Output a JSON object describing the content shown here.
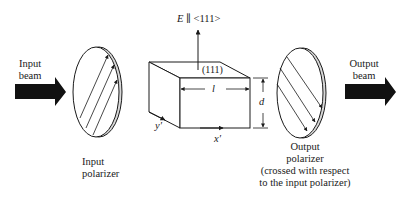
{
  "diagram": {
    "input_beam_label": [
      "Input",
      "beam"
    ],
    "output_beam_label": [
      "Output",
      "beam"
    ],
    "input_polarizer_label": [
      "Input",
      "polarizer"
    ],
    "output_polarizer_label": [
      "Output",
      "polarizer",
      "(crossed with respect",
      "to the input polarizer)"
    ],
    "field_label_E": "E",
    "field_label_rest": " ∥ <111>",
    "crystal_face_label": "(111)",
    "length_label": "l",
    "thickness_label": "d",
    "axis_x_label": "x′",
    "axis_y_label": "y′",
    "ink_color": "#1a1a1a",
    "polarizer_rim_color": "#d0d0d0"
  }
}
